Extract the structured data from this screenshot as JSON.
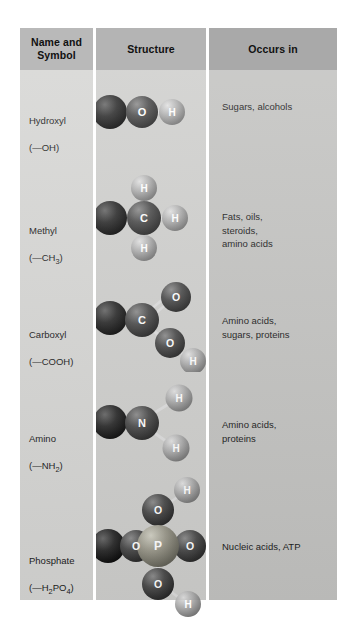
{
  "figure": {
    "headers": {
      "name": "Name and\nSymbol",
      "structure": "Structure",
      "occurs": "Occurs in"
    },
    "rows": [
      {
        "id": "hydroxyl",
        "name": "Hydroxyl",
        "symbol": "(—OH)",
        "occurs": "Sugars, alcohols",
        "atoms": [
          "O",
          "H"
        ]
      },
      {
        "id": "methyl",
        "name": "Methyl",
        "symbol": "(—CH3)",
        "symbol_base": "(—CH",
        "symbol_sub": "3",
        "symbol_tail": ")",
        "occurs": "Fats, oils,\nsteroids,\namino acids",
        "atoms": [
          "C",
          "H",
          "H",
          "H"
        ]
      },
      {
        "id": "carboxyl",
        "name": "Carboxyl",
        "symbol": "(—COOH)",
        "occurs": "Amino acids,\nsugars, proteins",
        "atoms": [
          "C",
          "O",
          "O",
          "H"
        ]
      },
      {
        "id": "amino",
        "name": "Amino",
        "symbol": "(—NH2)",
        "symbol_base": "(—NH",
        "symbol_sub": "2",
        "symbol_tail": ")",
        "occurs": "Amino acids,\nproteins",
        "atoms": [
          "N",
          "H",
          "H"
        ]
      },
      {
        "id": "phosphate",
        "name": "Phosphate",
        "symbol": "(—H2PO4)",
        "symbol_base": "(—H",
        "symbol_sub": "2",
        "symbol_mid": "PO",
        "symbol_sub2": "4",
        "symbol_tail": ")",
        "occurs": "Nucleic acids, ATP",
        "atoms": [
          "P",
          "O",
          "O",
          "O",
          "O",
          "H",
          "H"
        ]
      }
    ],
    "atom_labels": {
      "O": "O",
      "H": "H",
      "C": "C",
      "N": "N",
      "P": "P"
    },
    "colors": {
      "header_name_bg": "#b9b9b9",
      "header_struct_bg": "#b4b4b4",
      "header_occurs_bg": "#a9a9a9",
      "body_name_bg": "#d6d6d4",
      "body_struct_bg": "#cfcfcd",
      "body_occurs_bg": "#c3c3c1",
      "atom_dark": "#2a2a2a",
      "atom_oxygen": "#4a4a4a",
      "atom_hydrogen": "#a6a6a6",
      "atom_phosphorus": "#8e8e86",
      "text": "#1b1b1b"
    }
  }
}
